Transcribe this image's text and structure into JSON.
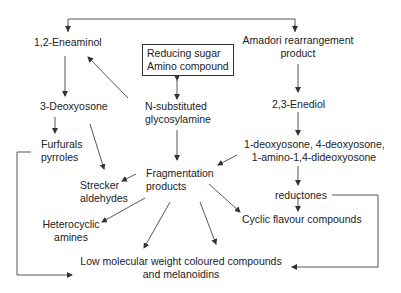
{
  "diagram": {
    "type": "flowchart",
    "nodes": {
      "reducing_sugar": {
        "line1": "Reducing sugar",
        "line2": "Amino compound"
      },
      "eneaminol": "1,2-Eneaminol",
      "amadori": {
        "line1": "Amadori rearrangement",
        "line2": "product"
      },
      "deoxyosone3": "3-Deoxyosone",
      "glycosylamine": {
        "line1": "N-substituted",
        "line2": "glycosylamine"
      },
      "enediol": "2,3-Enediol",
      "furfurals": {
        "line1": "Furfurals",
        "line2": "pyrroles"
      },
      "deoxyosones": {
        "line1": "1-deoxyosone, 4-deoxyosone,",
        "line2": "1-amino-1,4-dideoxyosone"
      },
      "fragmentation": {
        "line1": "Fragmentation",
        "line2": "products"
      },
      "strecker": {
        "line1": "Strecker",
        "line2": "aldehydes"
      },
      "reductones": "reductones",
      "heterocyclic": {
        "line1": "Heterocyclic",
        "line2": "amines"
      },
      "cyclic_flavour": "Cyclic flavour compounds",
      "melanoidins": {
        "line1": "Low molecular weight coloured compounds",
        "line2": "and melanoidins"
      }
    },
    "edges": [
      [
        "glycosylamine",
        "eneaminol"
      ],
      [
        "glycosylamine",
        "amadori"
      ],
      [
        "reducing_sugar",
        "glycosylamine",
        "bidirectional"
      ],
      [
        "eneaminol",
        "deoxyosone3"
      ],
      [
        "deoxyosone3",
        "furfurals"
      ],
      [
        "deoxyosone3",
        "strecker"
      ],
      [
        "glycosylamine",
        "fragmentation"
      ],
      [
        "amadori",
        "enediol"
      ],
      [
        "enediol",
        "deoxyosones"
      ],
      [
        "deoxyosones",
        "fragmentation"
      ],
      [
        "deoxyosones",
        "reductones"
      ],
      [
        "reductones",
        "cyclic_flavour"
      ],
      [
        "reductones",
        "melanoidins"
      ],
      [
        "fragmentation",
        "strecker"
      ],
      [
        "fragmentation",
        "heterocyclic"
      ],
      [
        "fragmentation",
        "melanoidins"
      ],
      [
        "fragmentation",
        "cyclic_flavour"
      ],
      [
        "furfurals",
        "melanoidins"
      ]
    ]
  }
}
